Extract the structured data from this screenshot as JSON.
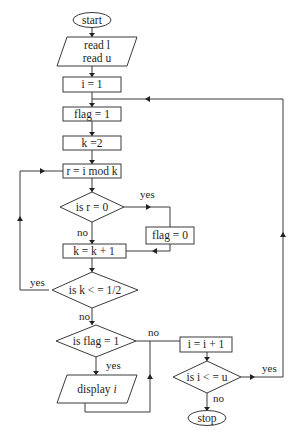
{
  "flowchart": {
    "nodes": {
      "start": "start",
      "read_line1": "read l",
      "read_line2": "read u",
      "init_i": "i = 1",
      "init_flag": "flag = 1",
      "init_k": "k =2",
      "compute_r": "r = i mod k",
      "decision_r": "is r = 0",
      "set_flag0": "flag = 0",
      "inc_k": "k = k + 1",
      "decision_k": "is k < = 1/2",
      "decision_flag": "is flag = 1",
      "display_prefix": "display ",
      "display_var": "i",
      "inc_i": "i = i + 1",
      "decision_i": "is i < = u",
      "stop": "stop"
    },
    "labels": {
      "r_yes": "yes",
      "r_no": "no",
      "k_yes": "yes",
      "k_no": "no",
      "flag_yes": "yes",
      "flag_no": "no",
      "i_yes": "yes",
      "i_no": "no"
    }
  }
}
